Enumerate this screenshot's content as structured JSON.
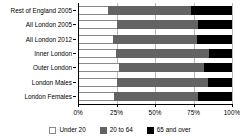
{
  "chart_data": {
    "type": "bar",
    "orientation": "horizontal",
    "stacked": true,
    "stack_mode": "percent",
    "title": "",
    "subtitle": "",
    "xlabel": "",
    "ylabel": "",
    "xlim": [
      0,
      100
    ],
    "grid": true,
    "grid_axis": "x",
    "legend_position": "bottom",
    "categories": [
      "Rest of England 2005",
      "All London 2005",
      "All London 2012",
      "Inner London",
      "Outer London",
      "London Males",
      "London Females"
    ],
    "xticks": [
      0,
      25,
      50,
      75,
      100
    ],
    "xtick_labels": [
      "0%",
      "25%",
      "50%",
      "75%",
      "100%"
    ],
    "series": [
      {
        "name": "Under 20",
        "color": "#ffffff",
        "values": [
          19,
          25,
          22,
          24,
          26,
          25,
          23
        ]
      },
      {
        "name": "20 to 64",
        "color": "#636363",
        "values": [
          54,
          53,
          55,
          61,
          56,
          59,
          55
        ]
      },
      {
        "name": "65 and over",
        "color": "#000000",
        "values": [
          27,
          22,
          23,
          15,
          18,
          16,
          22
        ]
      }
    ]
  },
  "legend": {
    "items": [
      {
        "label": "Under 20",
        "color": "#ffffff"
      },
      {
        "label": "20 to 64",
        "color": "#636363"
      },
      {
        "label": "65 and over",
        "color": "#000000"
      }
    ]
  },
  "colors": {
    "axis": "#000000",
    "grid": "#b9b9b9",
    "background": "#ffffff",
    "under20": "#ffffff",
    "mid": "#636363",
    "old": "#000000"
  }
}
